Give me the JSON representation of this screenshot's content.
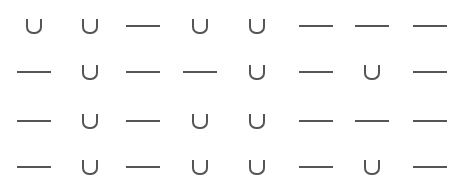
{
  "symbols": {
    "cup": "∪",
    "dash": "—"
  },
  "rows": [
    [
      "cup",
      "cup",
      "dash",
      "cup",
      "cup",
      "dash",
      "dash",
      "dash"
    ],
    [
      "dash",
      "cup",
      "dash",
      "dash",
      "cup",
      "dash",
      "cup",
      "dash"
    ],
    [
      "dash",
      "cup",
      "dash",
      "cup",
      "cup",
      "dash",
      "dash",
      "dash"
    ],
    [
      "dash",
      "cup",
      "dash",
      "cup",
      "cup",
      "dash",
      "cup",
      "dash"
    ]
  ],
  "colors": {
    "stroke": "#555555",
    "background": "#ffffff"
  }
}
